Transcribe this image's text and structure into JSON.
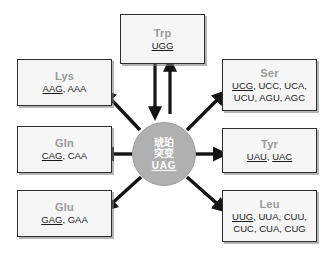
{
  "diagram": {
    "center": {
      "name": "center-node",
      "lines": [
        "琥珀",
        "突变"
      ],
      "codon": "UAG",
      "fill_color": "#b0b0b0",
      "text_color": "#ffffff"
    },
    "box_fill_color": "#f6f6f6",
    "box_border_color": "#2e2e2e",
    "aa_label_color": "#9a9a9a",
    "codon_text_color": "#1a1a1a",
    "nodes": [
      {
        "id": "trp",
        "aa": "Trp",
        "codon_lines": [
          [
            {
              "t": "UGG",
              "u": true
            }
          ]
        ],
        "arrow": "bidirectional"
      },
      {
        "id": "lys",
        "aa": "Lys",
        "codon_lines": [
          [
            {
              "t": "AAG",
              "u": true
            },
            {
              "t": ", AAA",
              "u": false
            }
          ]
        ],
        "arrow": "outward"
      },
      {
        "id": "ser",
        "aa": "Ser",
        "codon_lines": [
          [
            {
              "t": "UCG",
              "u": true
            },
            {
              "t": ", UCC, UCA,",
              "u": false
            }
          ],
          [
            {
              "t": "UCU, AGU, AGC",
              "u": false
            }
          ]
        ],
        "arrow": "outward"
      },
      {
        "id": "gln",
        "aa": "Gln",
        "codon_lines": [
          [
            {
              "t": "CAG",
              "u": true
            },
            {
              "t": ", CAA",
              "u": false
            }
          ]
        ],
        "arrow": "outward"
      },
      {
        "id": "tyr",
        "aa": "Tyr",
        "codon_lines": [
          [
            {
              "t": "UAU",
              "u": true
            },
            {
              "t": ", ",
              "u": false
            },
            {
              "t": "UAC",
              "u": true
            }
          ]
        ],
        "arrow": "outward"
      },
      {
        "id": "glu",
        "aa": "Glu",
        "codon_lines": [
          [
            {
              "t": "GAG",
              "u": true
            },
            {
              "t": ", GAA",
              "u": false
            }
          ]
        ],
        "arrow": "outward"
      },
      {
        "id": "leu",
        "aa": "Leu",
        "codon_lines": [
          [
            {
              "t": "UUG",
              "u": true
            },
            {
              "t": ", UUA, CUU,",
              "u": false
            }
          ],
          [
            {
              "t": "CUC, CUA, CUG",
              "u": false
            }
          ]
        ],
        "arrow": "outward"
      }
    ]
  }
}
